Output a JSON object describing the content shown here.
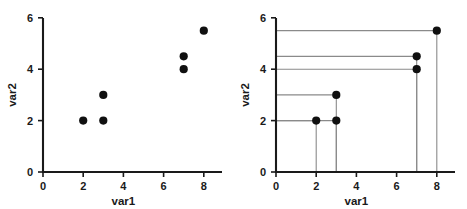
{
  "figure": {
    "background": "#ffffff",
    "point_color": "#101010",
    "axis_color": "#1a1a1a",
    "guide_color": "#8a8a8a",
    "panels": [
      "left",
      "right"
    ]
  },
  "chart_data": [
    {
      "type": "scatter",
      "panel": "left",
      "title": "",
      "xlabel": "var1",
      "ylabel": "var2",
      "xlim": [
        0,
        9
      ],
      "ylim": [
        0,
        6
      ],
      "xticks": [
        0,
        2,
        4,
        6,
        8
      ],
      "xtick_labels": [
        "0",
        "2",
        "4",
        "6",
        "8"
      ],
      "yticks": [
        0,
        2,
        4,
        6
      ],
      "ytick_labels": [
        "0",
        "2",
        "4",
        "6"
      ],
      "grid": false,
      "legend": null,
      "points": [
        {
          "var1": 2,
          "var2": 2
        },
        {
          "var1": 3,
          "var2": 2
        },
        {
          "var1": 3,
          "var2": 3
        },
        {
          "var1": 7,
          "var2": 4
        },
        {
          "var1": 7,
          "var2": 4.5
        },
        {
          "var1": 8,
          "var2": 5.5
        }
      ]
    },
    {
      "type": "scatter",
      "panel": "right",
      "title": "",
      "xlabel": "var1",
      "ylabel": "var2",
      "xlim": [
        0,
        9
      ],
      "ylim": [
        0,
        6
      ],
      "xticks": [
        0,
        2,
        4,
        6,
        8
      ],
      "xtick_labels": [
        "0",
        "2",
        "4",
        "6",
        "8"
      ],
      "yticks": [
        0,
        2,
        4,
        6
      ],
      "ytick_labels": [
        "0",
        "2",
        "4",
        "6"
      ],
      "grid": false,
      "legend": null,
      "points": [
        {
          "var1": 2,
          "var2": 2
        },
        {
          "var1": 3,
          "var2": 2
        },
        {
          "var1": 3,
          "var2": 3
        },
        {
          "var1": 7,
          "var2": 4
        },
        {
          "var1": 7,
          "var2": 4.5
        },
        {
          "var1": 8,
          "var2": 5.5
        }
      ],
      "guides": {
        "description": "horizontal line from y-axis to each point and vertical line from each point down to x-axis",
        "horizontal": true,
        "vertical": true
      }
    }
  ],
  "labels": {
    "left": {
      "xlabel": "var1",
      "ylabel": "var2",
      "xticks": [
        "0",
        "2",
        "4",
        "6",
        "8"
      ],
      "yticks": [
        "0",
        "2",
        "4",
        "6"
      ]
    },
    "right": {
      "xlabel": "var1",
      "ylabel": "var2",
      "xticks": [
        "0",
        "2",
        "4",
        "6",
        "8"
      ],
      "yticks": [
        "0",
        "2",
        "4",
        "6"
      ]
    }
  }
}
